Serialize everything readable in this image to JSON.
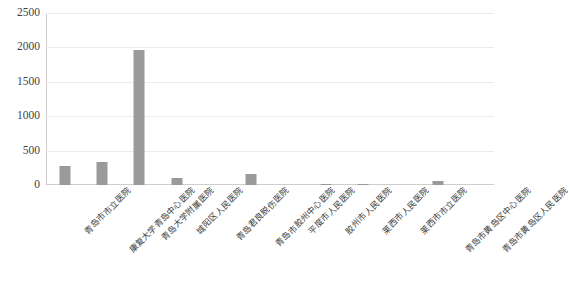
{
  "chart_data": {
    "type": "bar",
    "title": "",
    "subtitle": "",
    "xlabel": "",
    "ylabel": "",
    "grid": true,
    "legend": false,
    "legend_position": "none",
    "bar_color": "#9a9a9a",
    "gridline_color": "#eceaea",
    "axis_color": "#d0cecd",
    "ylim": [
      0,
      2500
    ],
    "ytick_labels": [
      "0",
      "500",
      "1000",
      "1500",
      "2000",
      "2500"
    ],
    "ytick_values": [
      0,
      500,
      1000,
      1500,
      2000,
      2500
    ],
    "categories": [
      "青岛市市立医院",
      "康复大学青岛中心医院",
      "青岛大学附属医院",
      "城阳区人民医院",
      "青岛君良脱伤医院",
      "青岛市胶州中心医院",
      "平度市人民医院",
      "胶州市人民医院",
      "莱西市人民医院",
      "莱西市市立医院",
      "青岛市黄岛区中心医院",
      "青岛市黄岛区人民医院"
    ],
    "values": [
      272,
      330,
      1965,
      105,
      0,
      160,
      0,
      22,
      18,
      0,
      55,
      0
    ],
    "series": [
      {
        "name": "数量",
        "values": [
          272,
          330,
          1965,
          105,
          0,
          160,
          0,
          22,
          18,
          0,
          55,
          0
        ]
      }
    ]
  }
}
